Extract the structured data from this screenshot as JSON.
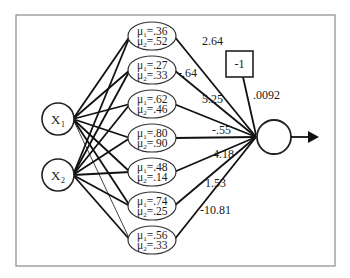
{
  "diagram": {
    "type": "rbf-network",
    "inputs": [
      {
        "id": "x1",
        "label": "X",
        "subscript": "1"
      },
      {
        "id": "x2",
        "label": "X",
        "subscript": "2"
      }
    ],
    "hidden": [
      {
        "mu1": ".36",
        "mu2": ".52",
        "weight": "2.64"
      },
      {
        "mu1": ".27",
        "mu2": ".33",
        "weight": "-.64"
      },
      {
        "mu1": ".62",
        "mu2": ".46",
        "weight": "5.25"
      },
      {
        "mu1": ".80",
        "mu2": ".90",
        "weight": "-.55"
      },
      {
        "mu1": ".48",
        "mu2": ".14",
        "weight": "4.18"
      },
      {
        "mu1": ".74",
        "mu2": ".25",
        "weight": "1.53"
      },
      {
        "mu1": ".56",
        "mu2": ".33",
        "weight": "-10.81"
      }
    ],
    "mu_symbol": "μ",
    "bias": {
      "label": "-1",
      "weight": ".0092"
    },
    "output": {
      "id": "output-node"
    }
  }
}
